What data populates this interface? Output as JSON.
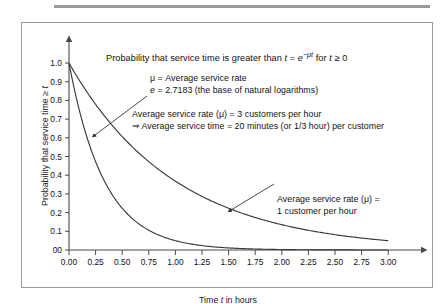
{
  "chart_data": {
    "type": "line",
    "title": "Probability that service time is greater than t = e−μt for t ≥ 0",
    "title_parts": {
      "lead": "Probability that service time is greater than ",
      "var_t": "t",
      "eq": " = ",
      "base_e": "e",
      "exponent": "−μt",
      "tail_lead": " for ",
      "tail_var": "t",
      "tail_cond": " ≥ 0"
    },
    "xlabel": "Time t in hours",
    "xlabel_parts": {
      "lead": "Time ",
      "var": "t",
      "tail": " in hours"
    },
    "ylabel": "Probability that service time ≥ t",
    "ylabel_parts": {
      "lead": "Probability that service time ≥ ",
      "var": "t"
    },
    "xlim": [
      0,
      3
    ],
    "ylim": [
      0,
      1
    ],
    "grid": false,
    "legend": "none",
    "xticks": [
      "0.00",
      "0.25",
      "0.50",
      "0.75",
      "1.00",
      "1.25",
      "1.50",
      "1.75",
      "2.00",
      "2.25",
      "2.50",
      "2.75",
      "3.00"
    ],
    "xtick_values": [
      0,
      0.25,
      0.5,
      0.75,
      1.0,
      1.25,
      1.5,
      1.75,
      2.0,
      2.25,
      2.5,
      2.75,
      3.0
    ],
    "yticks": [
      "0.0",
      "0.1",
      "0.2",
      "0.3",
      "0.4",
      "0.5",
      "0.6",
      "0.7",
      "0.8",
      "0.9",
      "1.0"
    ],
    "ytick_values": [
      0,
      0.1,
      0.2,
      0.3,
      0.4,
      0.5,
      0.6,
      0.7,
      0.8,
      0.9,
      1.0
    ],
    "ytick_zero_label": "00",
    "series": [
      {
        "name": "Average service rate (μ) = 1 customer per hour",
        "mu": 1,
        "formula": "e^(-1t)",
        "color": "#3a3a3a",
        "x": [
          0,
          0.25,
          0.5,
          0.75,
          1.0,
          1.25,
          1.5,
          1.75,
          2.0,
          2.25,
          2.5,
          2.75,
          3.0
        ],
        "values": [
          1.0,
          0.779,
          0.607,
          0.472,
          0.368,
          0.287,
          0.223,
          0.174,
          0.135,
          0.105,
          0.082,
          0.064,
          0.05
        ]
      },
      {
        "name": "Average service rate (μ) = 3 customers per hour",
        "mu": 3,
        "formula": "e^(-3t)",
        "color": "#3a3a3a",
        "x": [
          0,
          0.25,
          0.5,
          0.75,
          1.0,
          1.25,
          1.5,
          1.75,
          2.0,
          2.25,
          2.5,
          2.75,
          3.0
        ],
        "values": [
          1.0,
          0.472,
          0.223,
          0.105,
          0.05,
          0.024,
          0.011,
          0.005,
          0.002,
          0.001,
          0.001,
          0.0,
          0.0
        ]
      }
    ],
    "annotations": [
      {
        "id": "definitions",
        "lines": [
          "μ = Average service rate",
          "e = 2.7183 (the base of natural logarithms)"
        ],
        "line1_parts": {
          "text": "μ = Average service rate"
        },
        "line2_parts": {
          "var": "e",
          "text": " = 2.7183 (the base of natural logarithms)"
        }
      },
      {
        "id": "mu3-callout",
        "lines": [
          "Average service rate (μ) = 3 customers per hour",
          "⇒ Average service time = 20 minutes (or 1/3 hour) per customer"
        ],
        "points_to_series": "Average service rate (μ) = 3 customers per hour"
      },
      {
        "id": "mu1-callout",
        "lines": [
          "Average service rate (μ) =",
          "1 customer per hour"
        ],
        "points_to_series": "Average service rate (μ) = 1 customer per hour"
      }
    ],
    "colors": {
      "curve": "#3a3a3a",
      "axis": "#4a4a4a",
      "frame": "#9a9a9a",
      "text": "#111111",
      "background": "#ffffff"
    }
  }
}
